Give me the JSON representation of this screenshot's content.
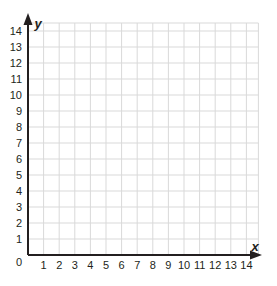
{
  "chart_data": {
    "type": "scatter",
    "title": "",
    "xlabel": "x",
    "ylabel": "y",
    "xlim": [
      0,
      14
    ],
    "ylim": [
      0,
      14
    ],
    "grid": true,
    "x_ticks": [
      "1",
      "2",
      "3",
      "4",
      "5",
      "6",
      "7",
      "8",
      "9",
      "10",
      "11",
      "12",
      "13",
      "14"
    ],
    "y_ticks": [
      "1",
      "2",
      "3",
      "4",
      "5",
      "6",
      "7",
      "8",
      "9",
      "10",
      "11",
      "12",
      "13",
      "14"
    ],
    "origin_label": "0",
    "series": [],
    "colors": {
      "grid": "#d9d9d9",
      "axis": "#231f20",
      "background": "#ffffff"
    }
  }
}
